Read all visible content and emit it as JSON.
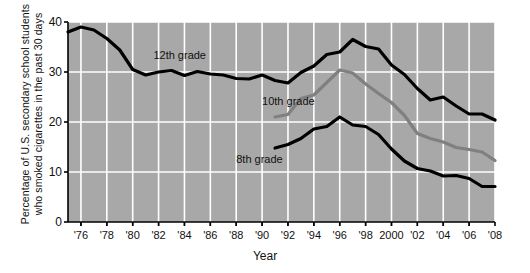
{
  "chart_data": {
    "type": "line",
    "title": "",
    "xlabel": "Year",
    "ylabel": "Percentage of U.S. secondary school students who smoked cigarettes in the past 30 days",
    "ylabel_lines": [
      "Percentage of U.S. secondary school students",
      "who smoked cigarettes in the past 30 days"
    ],
    "xlim": [
      1975,
      2008
    ],
    "ylim": [
      0,
      40
    ],
    "yticks": [
      0,
      10,
      20,
      30,
      40
    ],
    "ytick_labels": [
      "0",
      "10",
      "20",
      "30",
      "40"
    ],
    "xticks": [
      1976,
      1978,
      1980,
      1982,
      1984,
      1986,
      1988,
      1990,
      1992,
      1994,
      1996,
      1998,
      2000,
      2002,
      2004,
      2006,
      2008
    ],
    "xtick_labels": [
      "'76",
      "'78",
      "'80",
      "'82",
      "'84",
      "'86",
      "'88",
      "'90",
      "'92",
      "'94",
      "'96",
      "'98",
      "2000",
      "'02",
      "'04",
      "'06",
      "'08"
    ],
    "grid": true,
    "grid_color": "#ffffff",
    "plot_background": "#a8a8a8",
    "legend": "inline-labels",
    "series": [
      {
        "name": "12th grade",
        "color": "#000000",
        "label_x": 1981.6,
        "label_y": 33.2,
        "x": [
          1975,
          1976,
          1977,
          1978,
          1979,
          1980,
          1981,
          1982,
          1983,
          1984,
          1985,
          1986,
          1987,
          1988,
          1989,
          1990,
          1991,
          1992,
          1993,
          1994,
          1995,
          1996,
          1997,
          1998,
          1999,
          2000,
          2001,
          2002,
          2003,
          2004,
          2005,
          2006,
          2007,
          2008
        ],
        "values": [
          38.0,
          39.0,
          38.4,
          36.7,
          34.4,
          30.5,
          29.4,
          30.0,
          30.3,
          29.3,
          30.1,
          29.6,
          29.4,
          28.7,
          28.6,
          29.4,
          28.3,
          27.8,
          29.9,
          31.2,
          33.5,
          34.0,
          36.5,
          35.1,
          34.6,
          31.4,
          29.5,
          26.7,
          24.4,
          25.0,
          23.2,
          21.6,
          21.6,
          20.4
        ]
      },
      {
        "name": "10th grade",
        "color": "#808080",
        "label_x": 1990.0,
        "label_y": 24.0,
        "x": [
          1991,
          1992,
          1993,
          1994,
          1995,
          1996,
          1997,
          1998,
          1999,
          2000,
          2001,
          2002,
          2003,
          2004,
          2005,
          2006,
          2007,
          2008
        ],
        "values": [
          21.0,
          21.5,
          24.7,
          25.4,
          27.9,
          30.4,
          29.8,
          27.6,
          25.7,
          23.9,
          21.3,
          17.7,
          16.7,
          16.0,
          14.9,
          14.5,
          14.0,
          12.3
        ]
      },
      {
        "name": "8th grade",
        "color": "#000000",
        "label_x": 1988.0,
        "label_y": 12.5,
        "x": [
          1991,
          1992,
          1993,
          1994,
          1995,
          1996,
          1997,
          1998,
          1999,
          2000,
          2001,
          2002,
          2003,
          2004,
          2005,
          2006,
          2007,
          2008
        ],
        "values": [
          14.8,
          15.5,
          16.7,
          18.6,
          19.1,
          21.0,
          19.4,
          19.1,
          17.5,
          14.6,
          12.2,
          10.7,
          10.2,
          9.2,
          9.3,
          8.7,
          7.1,
          7.1
        ]
      }
    ]
  }
}
